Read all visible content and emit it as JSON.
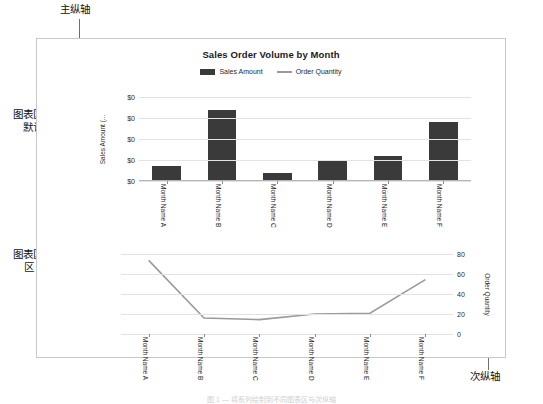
{
  "annotations": {
    "primary_axis": "主纵轴",
    "secondary_axis": "次纵轴",
    "chart_area_default": "图表区：\n默认",
    "chart_area_default_line1": "图表区：",
    "chart_area_default_line2": "默认",
    "chart_area_1_line1": "图表区：",
    "chart_area_1_line2": "区 1"
  },
  "chart_data": {
    "type": "bar",
    "title": "Sales Order Volume by Month",
    "xlabel": "",
    "ylabel": "Sales Amount (...",
    "y2label": "Order Quantity",
    "categories": [
      "Month Name A",
      "Month Name B",
      "Month Name C",
      "Month Name D",
      "Month Name E",
      "Month Name F"
    ],
    "legend": [
      "Sales Amount",
      "Order Quantity"
    ],
    "legend_position": "top-center",
    "grid": true,
    "primary_axis": {
      "ticks": [
        "$0",
        "$0",
        "$0",
        "$0",
        "$0"
      ],
      "ylim": [
        0,
        6
      ]
    },
    "secondary_axis": {
      "ticks": [
        "0",
        "20",
        "40",
        "60",
        "80"
      ],
      "ylim": [
        0,
        100
      ]
    },
    "series": [
      {
        "name": "Sales Amount",
        "type": "bar",
        "axis": "primary",
        "color": "#3a3a3a",
        "values": [
          1.1,
          5.1,
          0.6,
          1.4,
          1.8,
          4.2
        ]
      },
      {
        "name": "Order Quantity",
        "type": "line",
        "axis": "secondary",
        "color": "#9a9a9a",
        "values": [
          92,
          20,
          18,
          25,
          26,
          68
        ]
      }
    ]
  },
  "caption": "图 1 — 将系列绘制到不同图表区与次纵轴"
}
